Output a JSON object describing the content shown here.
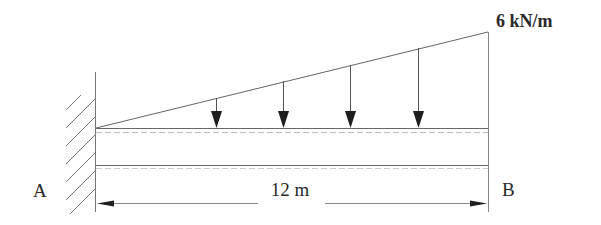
{
  "diagram": {
    "type": "cantilever-beam-load-diagram",
    "load": {
      "label": "6 kN/m",
      "shape": "linearly-varying (triangular)",
      "start_intensity": 0,
      "end_intensity": 6,
      "unit": "kN/m",
      "arrow_count": 4
    },
    "support_left": {
      "label": "A",
      "type": "fixed-wall"
    },
    "end_right": {
      "label": "B",
      "type": "free-end"
    },
    "span": {
      "label": "12 m",
      "value": 12,
      "unit": "m"
    },
    "colors": {
      "line": "#555555",
      "arrow": "#1e1e1e",
      "text": "#2a2a2a",
      "background": "#ffffff"
    }
  }
}
